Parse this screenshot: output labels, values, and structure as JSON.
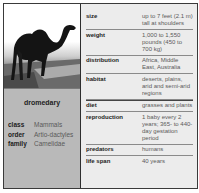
{
  "animal": {
    "name": "dromedary",
    "photo": "camel-photo",
    "taxonomy": [
      {
        "label": "class",
        "value": "Mammals"
      },
      {
        "label": "order",
        "value": "Artio-dactyles"
      },
      {
        "label": "family",
        "value": "Camelidae"
      }
    ]
  },
  "facts": [
    {
      "label": "size",
      "value": "up to 7 feet (2.1 m) tall at shoulders"
    },
    {
      "label": "weight",
      "value": "1,000 to 1,550 pounds (450 to 700 kg)"
    },
    {
      "label": "distribution",
      "value": "Africa, Middle East, Australia"
    },
    {
      "label": "habitat",
      "value": "deserts, plains, arid and semi-arid regions"
    },
    {
      "label": "diet",
      "value": "grasses and plants"
    },
    {
      "label": "reproduction",
      "value": "1 baby every 2 years; 365- to 440-day gestation period"
    },
    {
      "label": "predators",
      "value": "humans"
    },
    {
      "label": "life span",
      "value": "40 years"
    }
  ],
  "colors": {
    "border": "#3a3a3a",
    "panel_light": "#ececec",
    "panel_gray": "#b9b9b9",
    "label_text": "#1c1c1c",
    "value_text": "#5a5a5a"
  }
}
